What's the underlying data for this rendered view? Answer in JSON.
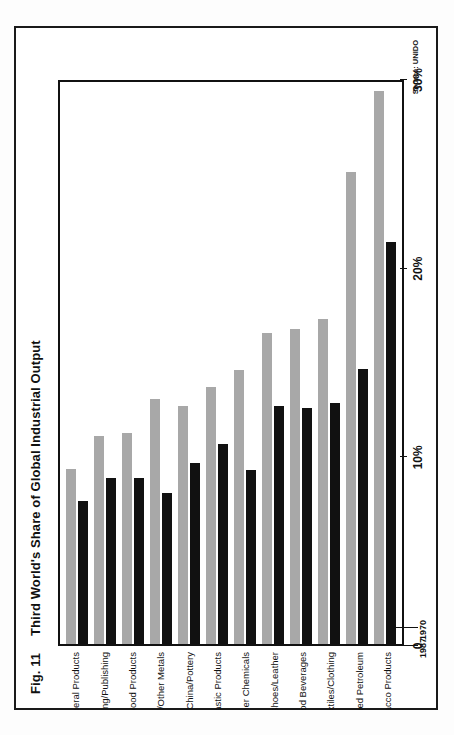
{
  "figure": {
    "number": "Fig. 11",
    "title": "Third World's Share of Global Industrial Output",
    "source": "Source: UNIDO"
  },
  "chart_data": {
    "type": "bar",
    "orientation": "horizontal-rotated",
    "title": "Third World's Share of Global Industrial Output",
    "xlabel": "",
    "ylabel": "",
    "xlim": [
      0,
      30
    ],
    "grid": false,
    "legend_position": "bottom-left",
    "tick_labels": [
      "0",
      "10%",
      "20%",
      "30%"
    ],
    "tick_values": [
      0,
      10,
      20,
      30
    ],
    "categories": [
      "Non-Metal Mineral Products",
      "Paper/Printing/Publishing",
      "Wood/Furniture/Wood Products",
      "Iron/Steel/Other Metals",
      "Glass/China/Pottery",
      "Rubber/ Plastic Products",
      "Industrial/Other Chemicals",
      "Shoes/Leather",
      "Food Beverages",
      "Textiles/Clothing",
      "Refined Petroleum",
      "Tobacco Products"
    ],
    "series": [
      {
        "name": "1987",
        "color": "#a8a8a8",
        "values": [
          9.3,
          11.0,
          11.2,
          13.0,
          12.6,
          13.6,
          14.5,
          16.5,
          16.7,
          17.2,
          25.0,
          29.3
        ]
      },
      {
        "name": "1970",
        "color": "#111111",
        "values": [
          7.6,
          8.8,
          8.8,
          8.0,
          9.6,
          10.6,
          9.2,
          12.6,
          12.5,
          12.8,
          14.6,
          21.3
        ]
      }
    ]
  }
}
